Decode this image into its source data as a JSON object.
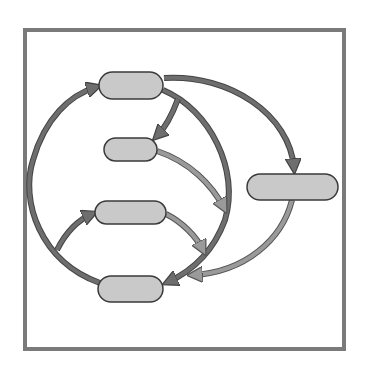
{
  "diagram": {
    "type": "cycle-flow",
    "frame": {
      "x": 25,
      "y": 30,
      "width": 319,
      "height": 319,
      "stroke": "#7a7a7a",
      "stroke_width": 4
    },
    "colors": {
      "node_fill": "#c9c9c9",
      "node_stroke": "#3a3a3a",
      "dark_edge": "#6e6e6e",
      "light_edge": "#9a9a9a",
      "edge_outline": "#4a4a4a"
    },
    "nodes": [
      {
        "id": "node-top",
        "label": "",
        "x": 99,
        "y": 72,
        "w": 64,
        "h": 27
      },
      {
        "id": "node-upper-mid",
        "label": "",
        "x": 104,
        "y": 138,
        "w": 53,
        "h": 23
      },
      {
        "id": "node-right",
        "label": "",
        "x": 247,
        "y": 174,
        "w": 91,
        "h": 26
      },
      {
        "id": "node-lower-mid",
        "label": "",
        "x": 95,
        "y": 201,
        "w": 71,
        "h": 23
      },
      {
        "id": "node-bottom",
        "label": "",
        "x": 98,
        "y": 276,
        "w": 65,
        "h": 26
      }
    ],
    "edges": [
      {
        "from": "node-bottom",
        "to": "node-top",
        "style": "dark",
        "route": "left-arc"
      },
      {
        "from": "node-top",
        "to": "node-bottom",
        "style": "dark",
        "route": "right-arc"
      },
      {
        "from": "node-top",
        "to": "node-upper-mid",
        "style": "dark",
        "route": "short-curve"
      },
      {
        "from": "node-top",
        "to": "node-right",
        "style": "dark",
        "route": "outer-arc"
      },
      {
        "from": "node-upper-mid",
        "to": "right-arc",
        "style": "light",
        "route": "curve"
      },
      {
        "from": "left-arc",
        "to": "node-lower-mid",
        "style": "dark",
        "route": "branch"
      },
      {
        "from": "node-lower-mid",
        "to": "right-arc",
        "style": "light",
        "route": "curve"
      },
      {
        "from": "node-right",
        "to": "node-bottom",
        "style": "light",
        "route": "lower-arc"
      }
    ]
  }
}
